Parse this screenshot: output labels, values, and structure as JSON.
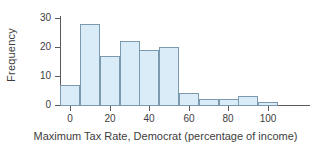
{
  "chart_data": {
    "type": "bar",
    "title": "",
    "xlabel": "Maximum Tax Rate, Democrat (percentage of income)",
    "ylabel": "Frequency",
    "xlim": [
      -10,
      115
    ],
    "ylim": [
      0,
      31
    ],
    "grid": false,
    "legend": null,
    "bin_width": 10,
    "bin_starts": [
      -5,
      5,
      15,
      25,
      35,
      45,
      55,
      65,
      75,
      85,
      95
    ],
    "bin_ends": [
      5,
      15,
      25,
      35,
      45,
      55,
      65,
      75,
      85,
      95,
      105
    ],
    "categories": [
      "-5 to 5",
      "5 to 15",
      "15 to 25",
      "25 to 35",
      "35 to 45",
      "45 to 55",
      "55 to 65",
      "65 to 75",
      "75 to 85",
      "85 to 95",
      "95 to 105"
    ],
    "values": [
      7,
      28,
      17,
      22,
      19,
      20,
      4,
      2,
      2,
      3,
      1
    ],
    "xticks": [
      0,
      20,
      40,
      60,
      80,
      100
    ],
    "xticklabels": [
      "0",
      "20",
      "40",
      "60",
      "80",
      "100"
    ],
    "yticks": [
      0,
      10,
      20,
      30
    ],
    "yticklabels": [
      "0",
      "10",
      "20",
      "30"
    ],
    "colors": {
      "bar_fill": "#d9ecf7",
      "bar_edge": "#7b9aad",
      "axis": "#5a5a5a",
      "text": "#3d3d3d",
      "background": "#ffffff"
    }
  }
}
